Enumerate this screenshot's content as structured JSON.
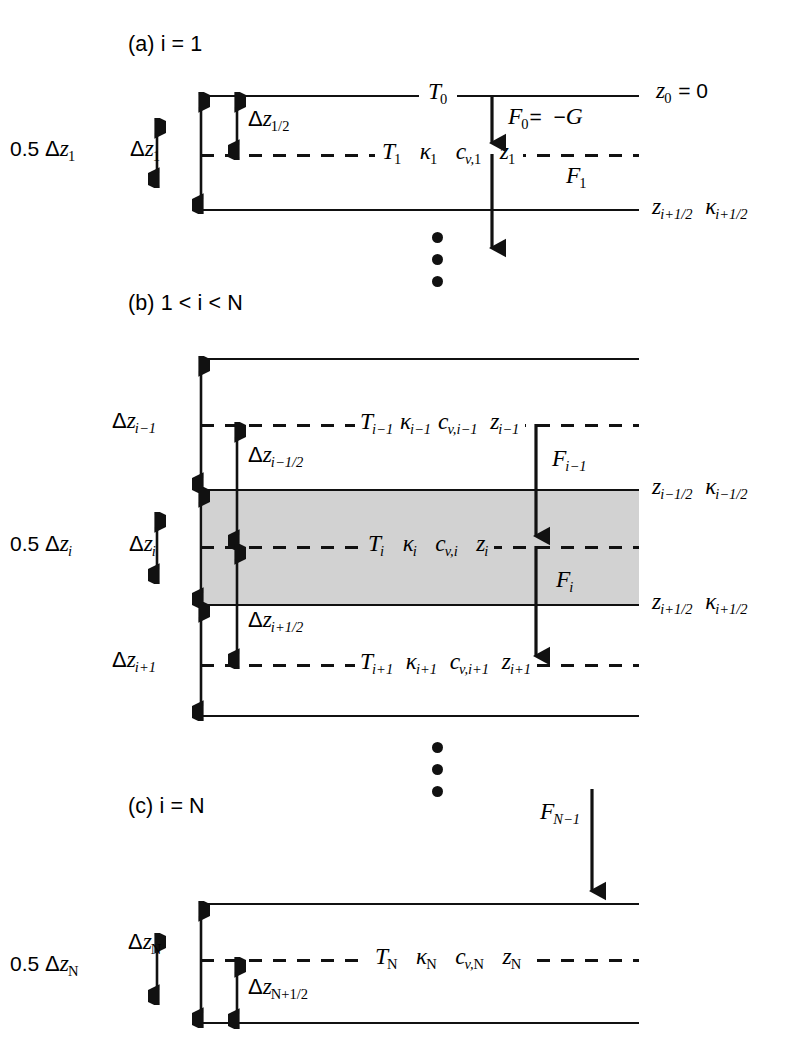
{
  "figure": {
    "type": "finite-difference vertical grid schematic",
    "background": "#ffffff",
    "ink": "#111111",
    "shade_color": "#d2d2d2"
  },
  "panels": {
    "a": {
      "title": "(a) i = 1",
      "left_margin_label": "0.5 Δz1",
      "thickness_label": "Δz1",
      "half_thickness_label": "Δz1/2",
      "surface_temperature": "T0",
      "surface_depth": "z0 = 0",
      "node_row": "T1  κ1  cv,1  z1",
      "flux_top": "F0 =  −G",
      "flux_bottom": "F1",
      "interface_label": "zi+1/2  κi+1/2"
    },
    "b": {
      "title": "(b) 1 < i < N",
      "left_margin_label": "0.5 Δzi",
      "thickness_above": "Δzi−1",
      "thickness_center": "Δzi",
      "thickness_below": "Δzi+1",
      "half_above": "Δzi−1/2",
      "half_below": "Δzi+1/2",
      "row_above": "Ti−1 κi−1 cv,i−1  zi−1",
      "row_center": "Ti   κi   cv,i   zi",
      "row_below": "Ti+1  κi+1  cv,i+1  zi+1",
      "flux_above": "Fi−1",
      "flux_center": "Fi",
      "interface_top": "zi−1/2  κi−1/2",
      "interface_bottom": "zi+1/2  κi+1/2"
    },
    "c": {
      "title": "(c) i = N",
      "left_margin_label": "0.5 ΔzN",
      "thickness_label": "ΔzN",
      "half_thickness_label": "ΔzN+1/2",
      "node_row": "TN  κN  cv,N  zN",
      "flux_in": "FN−1"
    }
  },
  "symbols": {
    "temperature": "T",
    "conductivity": "κ",
    "heat_capacity": "cv",
    "depth": "z",
    "flux": "F",
    "geothermal": "G",
    "thickness": "Δz"
  },
  "ellipses": {
    "between_a_and_b": "vertical three dots",
    "between_b_and_c": "vertical three dots",
    "dot_count": 3
  }
}
